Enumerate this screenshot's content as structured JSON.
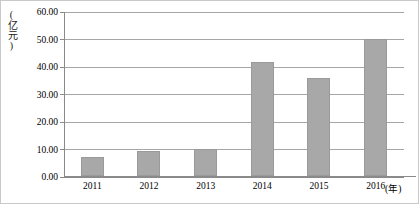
{
  "chart_data": {
    "type": "bar",
    "title": "",
    "subtitle": "",
    "xlabel": "(年)",
    "ylabel": "(亿元)",
    "categories": [
      "2011",
      "2012",
      "2013",
      "2014",
      "2015",
      "2016"
    ],
    "values": [
      7.0,
      9.0,
      10.0,
      41.5,
      35.5,
      50.0
    ],
    "series": [
      {
        "name": "",
        "values": [
          7.0,
          9.0,
          10.0,
          41.5,
          35.5,
          50.0
        ]
      }
    ],
    "ylim": [
      0.0,
      60.0
    ],
    "ytick_labels": [
      "0.00",
      "10.00",
      "20.00",
      "30.00",
      "40.00",
      "50.00",
      "60.00"
    ],
    "ytick_values": [
      0,
      10,
      20,
      30,
      40,
      50,
      60
    ],
    "grid": true,
    "legend": "none",
    "bar_color": "#a8a8a8",
    "grid_color": "#a6a6a6",
    "axis_color": "#8a8a8a",
    "background": "#ffffff"
  }
}
